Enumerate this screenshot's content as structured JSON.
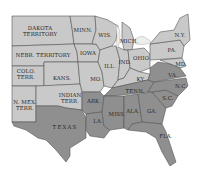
{
  "map": {
    "colors": {
      "background": "#ffffff",
      "union_fill": "#c9c9c9",
      "confederate_fill": "#8f8f8f",
      "water": "#eeeeee",
      "border": "#555555",
      "label": "#2b2b2b"
    },
    "labels": {
      "dakota": [
        "DAKOTA",
        "TERRITORY"
      ],
      "nebr": "NEBR. TERRITORY",
      "colo": [
        "COLO.",
        "TERR."
      ],
      "kans": "KANS.",
      "nmex": [
        "N. MEX.",
        "TERR."
      ],
      "indian": [
        "INDIAN",
        "TERR."
      ],
      "texas": "TEXAS",
      "minn": "MINN.",
      "iowa": "IOWA",
      "mo": "MO.",
      "ark": "ARK.",
      "la": "LA.",
      "wis": "WIS.",
      "ill": "ILL.",
      "mich": "MICH.",
      "ind": "IND.",
      "ohio": "OHIO",
      "ky": "KY.",
      "tenn": "TENN.",
      "miss": "MISS.",
      "ala": "ALA.",
      "ga": "GA.",
      "fla": "FLA.",
      "sc": "S.C.",
      "nc": "N.C.",
      "va": "VA.",
      "md": "MD.",
      "pa": "PA.",
      "ny": "N.Y."
    }
  }
}
